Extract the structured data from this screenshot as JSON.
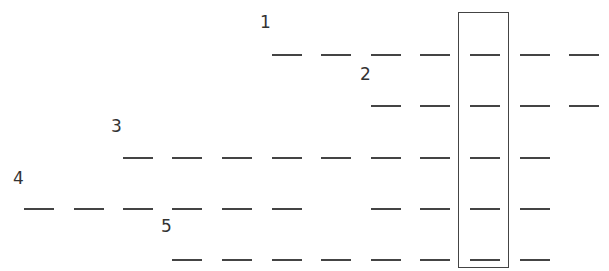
{
  "diagram": {
    "type": "staggered-dashed-rows",
    "dash_width": 30,
    "column_x": [
      24,
      74,
      123,
      172,
      222,
      272,
      321,
      371,
      420,
      470,
      520,
      569
    ],
    "rows": [
      {
        "label": "1",
        "label_x": 260,
        "label_y": 14,
        "y": 54,
        "columns": [
          5,
          6,
          7,
          8,
          9,
          10,
          11
        ]
      },
      {
        "label": "2",
        "label_x": 360,
        "label_y": 66,
        "y": 105,
        "columns": [
          7,
          8,
          9,
          10,
          11
        ]
      },
      {
        "label": "3",
        "label_x": 111,
        "label_y": 118,
        "y": 157,
        "columns": [
          2,
          3,
          4,
          5,
          6,
          7,
          8,
          9,
          10
        ]
      },
      {
        "label": "4",
        "label_x": 13,
        "label_y": 170,
        "y": 208,
        "columns": [
          0,
          1,
          2,
          3,
          4,
          5,
          7,
          8,
          9,
          10
        ]
      },
      {
        "label": "5",
        "label_x": 161,
        "label_y": 218,
        "y": 259,
        "columns": [
          3,
          4,
          5,
          6,
          7,
          8,
          9,
          10
        ]
      }
    ],
    "highlight_box": {
      "left": 458,
      "top": 12,
      "width": 51,
      "height": 256,
      "column_index": 9
    }
  }
}
